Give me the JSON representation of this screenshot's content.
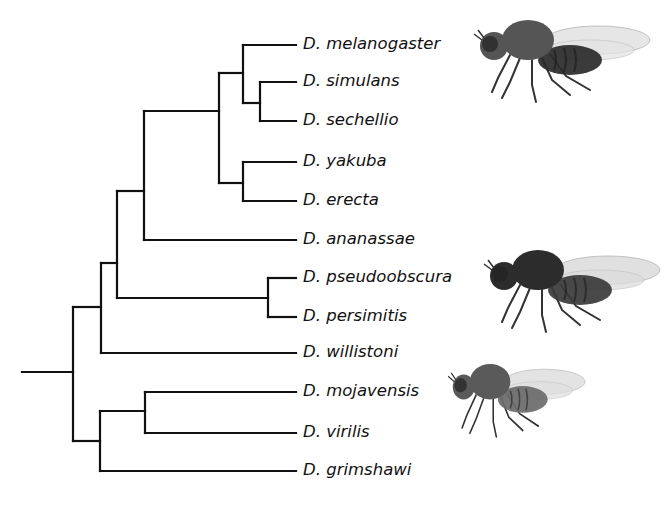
{
  "figure": {
    "type": "phylogenetic-tree",
    "line_color": "#111111",
    "background": "#ffffff"
  },
  "taxa": [
    {
      "label": "D. melanogaster",
      "y": 45
    },
    {
      "label": "D. simulans",
      "y": 82
    },
    {
      "label": "D. sechellio",
      "y": 121
    },
    {
      "label": "D. yakuba",
      "y": 162
    },
    {
      "label": "D. erecta",
      "y": 201
    },
    {
      "label": "D. ananassae",
      "y": 240
    },
    {
      "label": "D. pseudoobscura",
      "y": 278
    },
    {
      "label": "D. persimitis",
      "y": 317
    },
    {
      "label": "D. willistoni",
      "y": 353
    },
    {
      "label": "D. mojavensis",
      "y": 392
    },
    {
      "label": "D. virilis",
      "y": 433
    },
    {
      "label": "D. grimshawi",
      "y": 471
    }
  ],
  "tree": {
    "tip_x": 296,
    "root": {
      "x1": 22,
      "x2": 73,
      "y": 372
    },
    "nodes": [
      {
        "id": "root-node",
        "x": 73,
        "y1": 307,
        "y2": 441
      },
      {
        "id": "sophophora-plus-willistoni",
        "x": 101,
        "y1": 263,
        "y2": 353
      },
      {
        "id": "melanogaster-obscura",
        "x": 117,
        "y1": 191,
        "y2": 298
      },
      {
        "id": "melanogaster-group",
        "x": 144,
        "y1": 111,
        "y2": 240
      },
      {
        "id": "melanogaster-subgroup",
        "x": 219,
        "y1": 73,
        "y2": 183
      },
      {
        "id": "melanogaster-complex",
        "x": 243,
        "y1": 45,
        "y2": 103
      },
      {
        "id": "simulans-sechellio",
        "x": 260,
        "y1": 82,
        "y2": 121
      },
      {
        "id": "yakuba-erecta",
        "x": 243,
        "y1": 162,
        "y2": 201
      },
      {
        "id": "obscura-group",
        "x": 268,
        "y1": 278,
        "y2": 317
      },
      {
        "id": "drosophila-subgenus",
        "x": 100,
        "y1": 411,
        "y2": 471
      },
      {
        "id": "mojavensis-virilis",
        "x": 145,
        "y1": 392,
        "y2": 433
      }
    ],
    "edges": [
      {
        "x1": 73,
        "x2": 101,
        "y": 307
      },
      {
        "x1": 73,
        "x2": 100,
        "y": 441
      },
      {
        "x1": 101,
        "x2": 117,
        "y": 263
      },
      {
        "x1": 101,
        "x2": 296,
        "y": 353
      },
      {
        "x1": 117,
        "x2": 144,
        "y": 191
      },
      {
        "x1": 117,
        "x2": 268,
        "y": 298
      },
      {
        "x1": 144,
        "x2": 219,
        "y": 111
      },
      {
        "x1": 144,
        "x2": 296,
        "y": 240
      },
      {
        "x1": 219,
        "x2": 243,
        "y": 73
      },
      {
        "x1": 219,
        "x2": 243,
        "y": 183
      },
      {
        "x1": 243,
        "x2": 296,
        "y": 45
      },
      {
        "x1": 243,
        "x2": 260,
        "y": 103
      },
      {
        "x1": 260,
        "x2": 296,
        "y": 82
      },
      {
        "x1": 260,
        "x2": 296,
        "y": 121
      },
      {
        "x1": 243,
        "x2": 296,
        "y": 162
      },
      {
        "x1": 243,
        "x2": 296,
        "y": 201
      },
      {
        "x1": 268,
        "x2": 296,
        "y": 278
      },
      {
        "x1": 268,
        "x2": 296,
        "y": 317
      },
      {
        "x1": 100,
        "x2": 145,
        "y": 411
      },
      {
        "x1": 100,
        "x2": 296,
        "y": 471
      },
      {
        "x1": 145,
        "x2": 296,
        "y": 392
      },
      {
        "x1": 145,
        "x2": 296,
        "y": 433
      }
    ]
  },
  "illustrations": [
    {
      "name": "fly-illustration-melanogaster",
      "x": 470,
      "y": 10,
      "w": 180,
      "h": 90,
      "body": "#555555",
      "abdomen": "#2a2a2a",
      "wing": "#e4e4e4"
    },
    {
      "name": "fly-illustration-pseudoobscura",
      "x": 480,
      "y": 240,
      "w": 180,
      "h": 90,
      "body": "#2c2c2c",
      "abdomen": "#3a3a3a",
      "wing": "#dddddd"
    },
    {
      "name": "fly-illustration-mojavensis",
      "x": 445,
      "y": 355,
      "w": 140,
      "h": 80,
      "body": "#5a5a5a",
      "abdomen": "#6a6a6a",
      "wing": "#e0e0e0"
    }
  ]
}
